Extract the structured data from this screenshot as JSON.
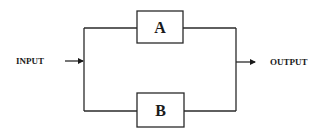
{
  "diagram": {
    "type": "parallel-block-diagram",
    "input_label": "INPUT",
    "output_label": "OUTPUT",
    "blocks": [
      {
        "id": "A",
        "label": "A"
      },
      {
        "id": "B",
        "label": "B"
      }
    ],
    "connections": [
      {
        "from": "INPUT",
        "to": "A"
      },
      {
        "from": "INPUT",
        "to": "B"
      },
      {
        "from": "A",
        "to": "OUTPUT"
      },
      {
        "from": "B",
        "to": "OUTPUT"
      }
    ]
  }
}
